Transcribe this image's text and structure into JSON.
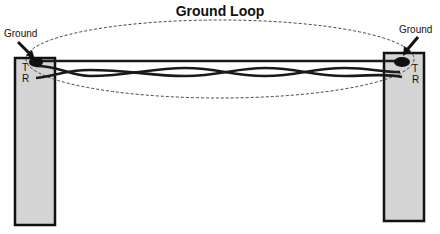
{
  "diagram": {
    "title": "Ground Loop",
    "left_end": {
      "ground_label": "Ground",
      "tip_label": "T",
      "ring_label": "R"
    },
    "right_end": {
      "ground_label": "Ground",
      "tip_label": "T",
      "ring_label": "R"
    },
    "colors": {
      "pole_fill": "#d4d4d4",
      "pole_stroke": "#111111",
      "wire": "#1a1a1a",
      "loop_dash": "#444444",
      "background": "#ffffff"
    },
    "elements": [
      "ground-loop-ellipse (dashed)",
      "ground-wire (straight, top)",
      "twisted-pair T/R",
      "left-pole",
      "right-pole",
      "ground-arrows"
    ]
  }
}
